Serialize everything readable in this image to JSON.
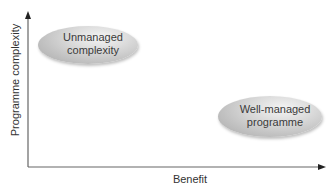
{
  "diagram": {
    "type": "quadrant-axes",
    "x_axis": {
      "label": "Benefit"
    },
    "y_axis": {
      "label": "Programme complexity"
    },
    "ellipses": [
      {
        "id": "unmanaged",
        "label": "Unmanaged\ncomplexity",
        "position": "high complexity, low benefit"
      },
      {
        "id": "well-managed",
        "label": "Well-managed\nprogramme",
        "position": "low complexity, high benefit"
      }
    ],
    "colors": {
      "axis": "#555555",
      "ellipse_fill": "#c8c8c8",
      "text": "#333333"
    }
  }
}
